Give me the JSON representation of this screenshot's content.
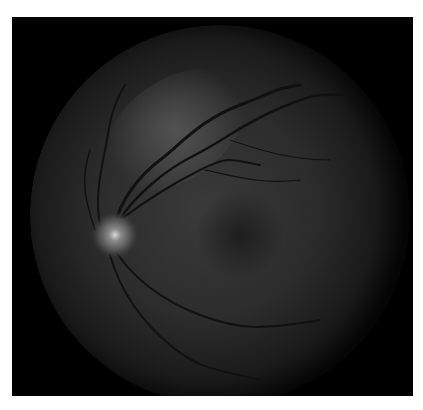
{
  "image": {
    "subject": "retinal fundus photograph",
    "mode": "grayscale",
    "background_color": "#ffffff",
    "frame_color": "#000000",
    "fundus_center": [
      220,
      215
    ],
    "fundus_radius": 190,
    "optic_disc_center": [
      115,
      235
    ],
    "optic_disc_radius": 20,
    "macula_center": [
      240,
      235
    ]
  }
}
